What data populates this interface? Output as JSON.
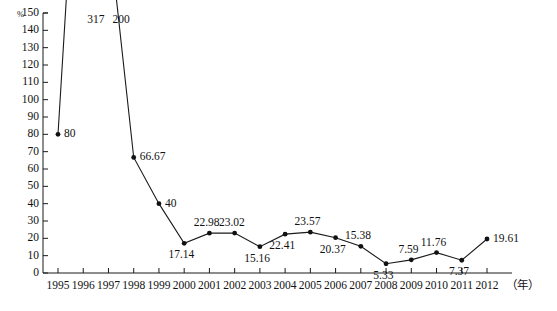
{
  "chart_data": {
    "type": "line",
    "title": "",
    "subtitle": "",
    "xlabel": "（年）",
    "ylabel": "%",
    "xlim": [
      1994.5,
      2012.9
    ],
    "ylim": [
      0,
      150
    ],
    "ytick_step": 10,
    "grid": false,
    "legend": null,
    "marker": "filled-circle",
    "line_color": "#1a1a1a",
    "note": "Values for 1996 (317) and 1997 (200) exceed the axis maximum of 150; their line segments run off the top of the plot area and only their labels are shown near the top.",
    "x": [
      1995,
      1996,
      1997,
      1998,
      1999,
      2000,
      2001,
      2002,
      2003,
      2004,
      2005,
      2006,
      2007,
      2008,
      2009,
      2010,
      2011,
      2012
    ],
    "categories": [
      "1995",
      "1996",
      "1997",
      "1998",
      "1999",
      "2000",
      "2001",
      "2002",
      "2003",
      "2004",
      "2005",
      "2006",
      "2007",
      "2008",
      "2009",
      "2010",
      "2011",
      "2012"
    ],
    "values": [
      80,
      317,
      200,
      66.67,
      40,
      17.14,
      22.98,
      23.02,
      15.16,
      22.41,
      23.57,
      20.37,
      15.38,
      5.33,
      7.59,
      11.76,
      7.37,
      19.61
    ],
    "data_labels": [
      "80",
      "317",
      "200",
      "66.67",
      "40",
      "17.14",
      "22.98",
      "23.02",
      "15.16",
      "22.41",
      "23.57",
      "20.37",
      "15.38",
      "5.33",
      "7.59",
      "11.76",
      "7.37",
      "19.61"
    ],
    "label_placement": [
      "right",
      "right-top",
      "right-top",
      "right",
      "right",
      "below",
      "above",
      "above",
      "below",
      "below",
      "above",
      "below",
      "above",
      "below",
      "above",
      "above",
      "below",
      "right"
    ],
    "off_scale_points": [
      {
        "year": "1996",
        "value": 317,
        "label": "317"
      },
      {
        "year": "1997",
        "value": 200,
        "label": "200"
      }
    ],
    "yticks": [
      "0",
      "10",
      "20",
      "30",
      "40",
      "50",
      "60",
      "70",
      "80",
      "90",
      "100",
      "110",
      "120",
      "130",
      "140",
      "150"
    ],
    "xticks": [
      "1995",
      "1996",
      "1997",
      "1998",
      "1999",
      "2000",
      "2001",
      "2002",
      "2003",
      "2004",
      "2005",
      "2006",
      "2007",
      "2008",
      "2009",
      "2010",
      "2011",
      "2012"
    ]
  },
  "axes": {
    "y_unit": "%",
    "x_unit": "（年）"
  },
  "caption": {
    "text": ""
  }
}
